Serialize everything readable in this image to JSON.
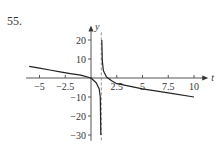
{
  "problem_number": "55.",
  "chart_data": {
    "type": "line",
    "title": "",
    "xlabel": "t",
    "ylabel": "y",
    "xlim": [
      -6,
      11
    ],
    "ylim": [
      -33,
      25
    ],
    "x_ticks": [
      -5,
      -2.5,
      2.5,
      5,
      7.5,
      10
    ],
    "x_tick_labels": [
      "−5",
      "−2.5",
      "2.5",
      "5",
      "7.5",
      "10"
    ],
    "y_ticks": [
      20,
      10,
      -10,
      -20,
      -30
    ],
    "y_tick_labels": [
      "20",
      "10",
      "−10",
      "−20",
      "−30"
    ],
    "grid": false,
    "asymptote": {
      "type": "vertical",
      "x": 1,
      "style": "dashed"
    },
    "series": [
      {
        "name": "left branch",
        "x": [
          -6,
          -5,
          -4,
          -3,
          -2,
          -1,
          0,
          0.5,
          0.8,
          0.9,
          0.95
        ],
        "values": [
          6.1,
          5.2,
          4.2,
          3.2,
          2.3,
          1.5,
          0,
          -2.5,
          -5.8,
          -10,
          -30
        ]
      },
      {
        "name": "right branch",
        "x": [
          1.05,
          1.1,
          1.2,
          1.5,
          2,
          2.5,
          3,
          5,
          7.5,
          10
        ],
        "values": [
          20,
          9,
          3.8,
          0.5,
          -1.5,
          -3,
          -3.5,
          -5.75,
          -7.8,
          -10
        ]
      }
    ]
  }
}
